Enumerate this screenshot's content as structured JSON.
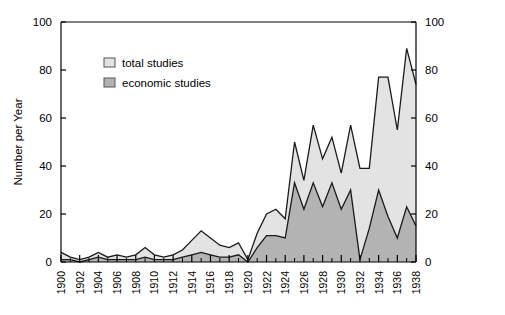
{
  "chart_data": {
    "type": "area",
    "title": "",
    "subtitle": "",
    "xlabel": "",
    "ylabel": "Number per Year",
    "ylabel_right": "",
    "xlim": [
      1900,
      1938
    ],
    "ylim": [
      0,
      100
    ],
    "grid": false,
    "legend_position": "upper-left-inside",
    "stacked": false,
    "x": [
      1900,
      1901,
      1902,
      1903,
      1904,
      1905,
      1906,
      1907,
      1908,
      1909,
      1910,
      1911,
      1912,
      1913,
      1914,
      1915,
      1916,
      1917,
      1918,
      1919,
      1920,
      1921,
      1922,
      1923,
      1924,
      1925,
      1926,
      1927,
      1928,
      1929,
      1930,
      1931,
      1932,
      1933,
      1934,
      1935,
      1936,
      1937,
      1938
    ],
    "series": [
      {
        "name": "total studies",
        "fill_color": "#e3e3e3",
        "line_color": "#1a1a1a",
        "values": [
          4,
          2,
          1,
          2,
          4,
          2,
          3,
          2,
          3,
          6,
          3,
          2,
          3,
          5,
          9,
          13,
          10,
          7,
          6,
          8,
          1,
          12,
          20,
          22,
          18,
          50,
          34,
          57,
          43,
          52,
          37,
          57,
          39,
          39,
          77,
          77,
          55,
          89,
          74
        ]
      },
      {
        "name": "economic studies",
        "fill_color": "#b3b3b3",
        "line_color": "#1a1a1a",
        "values": [
          1,
          1,
          0,
          1,
          2,
          1,
          1,
          1,
          1,
          2,
          1,
          1,
          1,
          2,
          3,
          4,
          3,
          2,
          2,
          3,
          0,
          6,
          11,
          11,
          10,
          33,
          22,
          33,
          23,
          33,
          22,
          30,
          1,
          14,
          30,
          19,
          10,
          23,
          15
        ]
      }
    ],
    "y_ticks": [
      0,
      20,
      40,
      60,
      80,
      100
    ],
    "y_ticks_right": [
      0,
      20,
      40,
      60,
      80,
      100
    ],
    "x_ticks": [
      1900,
      1902,
      1904,
      1906,
      1908,
      1910,
      1912,
      1914,
      1916,
      1918,
      1920,
      1922,
      1924,
      1926,
      1928,
      1930,
      1932,
      1934,
      1936,
      1938
    ],
    "x_minor_ticks": [
      1901,
      1903,
      1905,
      1907,
      1909,
      1911,
      1913,
      1915,
      1917,
      1919,
      1921,
      1923,
      1925,
      1927,
      1929,
      1931,
      1933,
      1935,
      1937
    ]
  },
  "legend": {
    "items": [
      {
        "label": "total studies",
        "swatch": "#e3e3e3"
      },
      {
        "label": "economic studies",
        "swatch": "#b3b3b3"
      }
    ]
  },
  "axes": {
    "y_title": "Number per Year"
  }
}
